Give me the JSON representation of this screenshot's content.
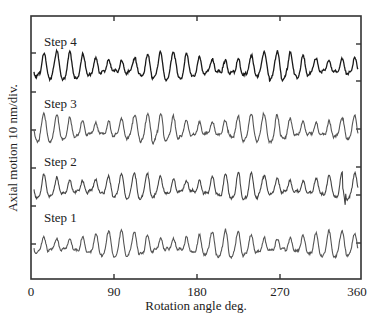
{
  "chart_data": {
    "type": "line",
    "title": "",
    "xlabel": "Rotation angle  deg.",
    "ylabel": "Axial motion 10 nm/div.",
    "xlim": [
      0,
      360
    ],
    "xticks": [
      0,
      90,
      180,
      270,
      360
    ],
    "xtick_labels": [
      "0",
      "90",
      "180",
      "270",
      "360"
    ],
    "grid": false,
    "legend": "none (inline step labels)",
    "y_units": "nm, traces vertically offset, 10 nm per division",
    "series": [
      {
        "name": "Step 4",
        "color": "#1a1a1a",
        "offset_div": 3,
        "cycles_per_rev": 25,
        "approx_peak_to_peak_nm": 12,
        "label_position_deg": 10
      },
      {
        "name": "Step 3",
        "color": "#555555",
        "offset_div": 2,
        "cycles_per_rev": 25,
        "approx_peak_to_peak_nm": 12,
        "label_position_deg": 10
      },
      {
        "name": "Step 2",
        "color": "#444444",
        "offset_div": 1,
        "cycles_per_rev": 25,
        "approx_peak_to_peak_nm": 11,
        "label_position_deg": 10,
        "annotation": "sharp downward spike near 345 deg"
      },
      {
        "name": "Step 1",
        "color": "#555555",
        "offset_div": 0,
        "cycles_per_rev": 25,
        "approx_peak_to_peak_nm": 11,
        "label_position_deg": 10
      }
    ]
  },
  "figure": {
    "caption_visible": "(caption text truncated / illegible)"
  }
}
